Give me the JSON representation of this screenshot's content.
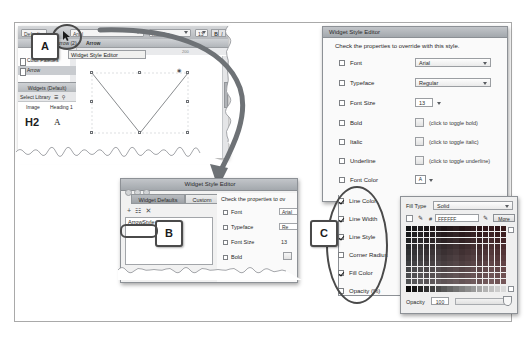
{
  "figure": {
    "callouts": [
      {
        "id": "A",
        "label": "A"
      },
      {
        "id": "B",
        "label": "B"
      },
      {
        "id": "C",
        "label": "C"
      }
    ]
  },
  "left_app": {
    "toolbar": {
      "default_label": "Default",
      "font_value": "Arial",
      "typeface_value": "Regular",
      "size_value": "13",
      "bold_label": "B",
      "italic_label": "I",
      "underline_label": "U"
    },
    "subbar": {
      "breadcrumb": "Arrow (2)",
      "page_label": "Arrow"
    },
    "ruler": {
      "marks_h": [
        "100",
        "200"
      ],
      "marks_v": [
        "100",
        "200"
      ]
    },
    "tooltip": "Widget Style Editor",
    "tree": {
      "items": [
        {
          "label": "Color Palettes",
          "selected": false
        },
        {
          "label": "Arrow",
          "selected": true
        }
      ]
    },
    "widgets_panel": {
      "header": "Widgets (Default)",
      "select_library": "Select Library",
      "items": [
        "Image",
        "Heading 1"
      ],
      "h2_sample": "H2",
      "a_sample": "A"
    }
  },
  "middle_dialog": {
    "title": "Widget Style Editor",
    "tabs": [
      {
        "label": "Widget Defaults",
        "active": true
      },
      {
        "label": "Custom",
        "active": false
      }
    ],
    "toolbar_icons": [
      "+",
      "duplicate-icon",
      "x"
    ],
    "style_list": [
      {
        "label": "ArrowStyle",
        "selected": true
      }
    ],
    "note": "Check the properties to ov",
    "properties": [
      {
        "label": "Font",
        "value": "Arial",
        "checked": false
      },
      {
        "label": "Typeface",
        "value": "Re",
        "checked": false
      },
      {
        "label": "Font Size",
        "value": "13",
        "checked": false
      },
      {
        "label": "Bold",
        "value": "",
        "checked": false
      }
    ]
  },
  "right_dialog": {
    "title": "Widget Style Editor",
    "heading": "Check the properties to override with this style.",
    "properties": [
      {
        "label": "Font",
        "control": "dropdown",
        "value": "Arial",
        "checked": false
      },
      {
        "label": "Typeface",
        "control": "dropdown",
        "value": "Regular",
        "checked": false
      },
      {
        "label": "Font Size",
        "control": "stepper",
        "value": "13",
        "checked": false
      },
      {
        "label": "Bold",
        "control": "toggle",
        "hint": "(click to toggle bold)",
        "checked": false
      },
      {
        "label": "Italic",
        "control": "toggle",
        "hint": "(click to toggle italic)",
        "checked": false
      },
      {
        "label": "Underline",
        "control": "toggle",
        "hint": "(click to toggle underline)",
        "checked": false
      },
      {
        "label": "Font Color",
        "control": "swatch",
        "checked": false
      },
      {
        "label": "Line Color",
        "control": "swatch",
        "checked": true
      },
      {
        "label": "Line Width",
        "control": "none",
        "checked": true
      },
      {
        "label": "Line Style",
        "control": "none",
        "checked": true
      },
      {
        "label": "Corner Radius",
        "control": "none",
        "checked": false
      },
      {
        "label": "Fill Color",
        "control": "none",
        "checked": true
      },
      {
        "label": "Opacity (%)",
        "control": "none",
        "checked": false
      }
    ]
  },
  "color_picker": {
    "fill_type_label": "Fill Type",
    "fill_type_value": "Solid",
    "hash_label": "#",
    "hex_value": "FFFFFF",
    "more_label": "More",
    "opacity_label": "Opacity",
    "opacity_value": "100"
  },
  "colors": {
    "titlebar": "#a9aeb3",
    "arrow": "#6e7276",
    "callout_border": "#4a4a4a",
    "selection": "#c8cbcf"
  }
}
